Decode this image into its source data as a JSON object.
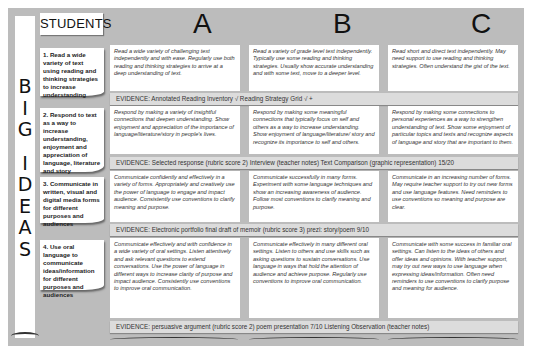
{
  "header": {
    "students_label": "STUDENTS",
    "columns": [
      "A",
      "B",
      "C"
    ],
    "big_ideas_letters": [
      "B",
      "I",
      "G",
      "",
      "I",
      "D",
      "E",
      "A",
      "S"
    ]
  },
  "rows": [
    {
      "idea": "1. Read a wide variety of text using reading and thinking strategies to increase understanding",
      "a": "Read a wide variety of challenging text independently and with ease. Regularly use both reading and thinking strategies to arrive at a deep understanding of text.",
      "b": "Read a variety of grade level text independently. Typically use some reading and thinking strategies. Usually show accurate understanding and with some text, move to a deeper level.",
      "c": "Read short and direct text independently. May need support to use reading and thinking strategies. Often understand the gist of the text.",
      "evidence": "EVIDENCE:  Annotated Reading Inventory √  Reading Strategy Grid √ +"
    },
    {
      "idea": "2. Respond to text as a way to increase understanding, enjoyment and appreciation of language, literature and story",
      "a": "Respond by making a variety of insightful connections that deepen understanding. Show enjoyment and appreciation of the importance of language/literature/story in people's lives.",
      "b": "Respond by making some meaningful connections that typically focus on self and others as a way to increase understanding. Show enjoyment of language/literature/ story and recognize its importance to self and others.",
      "c": "Respond by making some connections to personal experiences as a way to strengthen understanding of text. Show some enjoyment of particular topics and texts and recognize aspects of language and story that are important to them.",
      "evidence": "EVIDENCE:  Selected response (rubric score 2)  Interview (teacher notes)  Text Comparison (graphic representation) 15/20"
    },
    {
      "idea": "3. Communicate in written, visual and digital media forms for different purposes and audiences",
      "a": "Communicate confidently and effectively in a variety of forms. Appropriately and creatively use the power of language to engage and impact audience. Consistently use conventions to clarify meaning and purpose.",
      "b": "Communicate successfully in many forms. Experiment with some language techniques and show an increasing awareness of audience. Follow most conventions to clarify meaning and purpose.",
      "c": "Communicate in an increasing number of forms. May require teacher support to try out new forms and use language features. Need reminders to use conventions so meaning and purpose are clear.",
      "evidence": "EVIDENCE:  Electronic portfolio  final draft of memoir (rubric score 3)  prezi: story/poem 9/10"
    },
    {
      "idea": "4. Use oral language to communicate ideas/information for different purposes and audiences",
      "a": "Communicate effectively and with confidence in a wide variety of oral settings. Listen attentively and ask relevant questions to extend conversations. Use the power of language in different ways to increase clarity of purpose and impact audience. Consistently use conventions to improve oral communication.",
      "b": "Communicate effectively in many different oral settings. Listen to others and use skills such as asking questions to sustain conversations. Use language in ways that hold the attention of audience and achieve purpose. Regularly use conventions to improve oral communication.",
      "c": "Communicate with some success in familiar oral settings. Can listen to the ideas of others and offer ideas and opinions. With teacher support, may try out new ways to use language when expressing ideas/information. Often need reminders to use conventions to clarify purpose and meaning for audience.",
      "evidence": "EVIDENCE:  persuasive argument (rubric score 2)  poem presentation 7/10  Listening Observation (teacher notes)"
    }
  ],
  "colors": {
    "background": "#bcbcbc",
    "card": "#ffffff",
    "evidence_bar": "#dcdcdc",
    "text": "#333333"
  }
}
